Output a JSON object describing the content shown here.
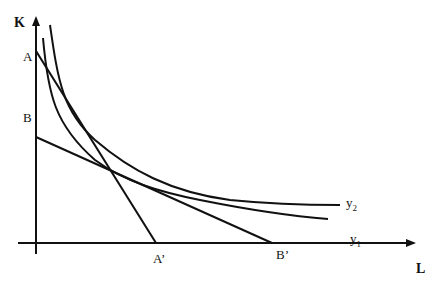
{
  "diagram": {
    "type": "isoquant-isocost",
    "axes": {
      "y_label": "K",
      "x_label": "L"
    },
    "points": {
      "A": "A",
      "B": "B",
      "A_prime": "A’",
      "B_prime": "B’"
    },
    "curves": [
      {
        "name": "y",
        "sub": "2"
      },
      {
        "name": "y",
        "sub": "1"
      }
    ],
    "lines": [
      {
        "from": "A",
        "to": "A’"
      },
      {
        "from": "B",
        "to": "B’"
      }
    ],
    "colors": {
      "stroke": "#111111",
      "background": "#ffffff"
    }
  }
}
